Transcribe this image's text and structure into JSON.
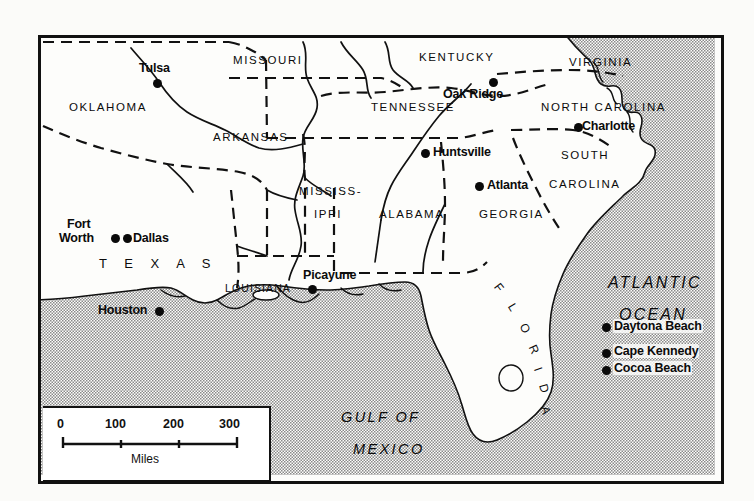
{
  "map": {
    "title": "Southeastern United States reference map",
    "frame": {
      "x": 38,
      "y": 35,
      "w": 680,
      "h": 443
    },
    "colors": {
      "land": "#fdfdfb",
      "water_stipple": "#8d8d8d",
      "ink": "#0b0b0b",
      "page": "#fbfaf8"
    }
  },
  "states": [
    {
      "name": "OKLAHOMA",
      "x": 28,
      "y": 63,
      "cls": "state"
    },
    {
      "name": "MISSOURI",
      "x": 192,
      "y": 16,
      "cls": "state"
    },
    {
      "name": "ARKANSAS",
      "x": 172,
      "y": 93,
      "cls": "state"
    },
    {
      "name": "KENTUCKY",
      "x": 378,
      "y": 13,
      "cls": "state"
    },
    {
      "name": "VIRGINIA",
      "x": 528,
      "y": 18,
      "cls": "state"
    },
    {
      "name": "TENNESSEE",
      "x": 330,
      "y": 63,
      "cls": "state"
    },
    {
      "name": "NORTH  CAROLINA",
      "x": 500,
      "y": 63,
      "cls": "state"
    },
    {
      "name": "SOUTH",
      "x": 520,
      "y": 111,
      "cls": "state"
    },
    {
      "name": "CAROLINA",
      "x": 508,
      "y": 140,
      "cls": "state"
    },
    {
      "name": "MISSISS-",
      "x": 258,
      "y": 147,
      "cls": "state"
    },
    {
      "name": "IPPI",
      "x": 273,
      "y": 170,
      "cls": "state"
    },
    {
      "name": "ALABAMA",
      "x": 338,
      "y": 170,
      "cls": "state"
    },
    {
      "name": "GEORGIA",
      "x": 438,
      "y": 170,
      "cls": "state"
    },
    {
      "name": "LOUISIANA",
      "x": 184,
      "y": 244,
      "cls": "state"
    },
    {
      "name": "T E X A S",
      "x": 58,
      "y": 218,
      "cls": "texas"
    }
  ],
  "florida_arc": {
    "letters": [
      "F",
      "L",
      "O",
      "R",
      "I",
      "D",
      "A"
    ],
    "label": "FLORIDA"
  },
  "cities": [
    {
      "name": "Tulsa",
      "label_x": 98,
      "label_y": 23,
      "dot_x": 112,
      "dot_y": 41,
      "anchor": "label-above"
    },
    {
      "name": "Oak Ridge",
      "label_x": 402,
      "label_y": 49,
      "dot_x": 448,
      "dot_y": 40,
      "anchor": "label-left-below"
    },
    {
      "name": "Charlotte",
      "label_x": 541,
      "label_y": 81,
      "dot_x": 533,
      "dot_y": 85,
      "anchor": "label-right"
    },
    {
      "name": "Huntsville",
      "label_x": 392,
      "label_y": 107,
      "dot_x": 380,
      "dot_y": 111,
      "anchor": "label-right"
    },
    {
      "name": "Atlanta",
      "label_x": 446,
      "label_y": 140,
      "dot_x": 434,
      "dot_y": 144,
      "anchor": "label-right"
    },
    {
      "name": "Fort",
      "label_x": 26,
      "label_y": 178,
      "dot_x": 71,
      "dot_y": 196,
      "anchor": "stacked"
    },
    {
      "name": "Worth",
      "label_x": 21,
      "label_y": 192,
      "dot_x": 71,
      "dot_y": 196,
      "anchor": "stacked"
    },
    {
      "name": "Dallas",
      "label_x": 90,
      "label_y": 192,
      "dot_x": 81,
      "dot_y": 196,
      "anchor": "label-right"
    },
    {
      "name": "Picayune",
      "label_x": 262,
      "label_y": 230,
      "dot_x": 267,
      "dot_y": 247,
      "anchor": "label-above"
    },
    {
      "name": "Houston",
      "label_x": 57,
      "label_y": 265,
      "dot_x": 114,
      "dot_y": 269,
      "anchor": "label-left"
    },
    {
      "name": "Daytona Beach",
      "label_x": 572,
      "label_y": 281,
      "dot_x": 561,
      "dot_y": 285,
      "anchor": "label-right"
    },
    {
      "name": "Cape Kennedy",
      "label_x": 572,
      "label_y": 307,
      "dot_x": 561,
      "dot_y": 311,
      "anchor": "label-right"
    },
    {
      "name": "Cocoa Beach",
      "label_x": 572,
      "label_y": 324,
      "dot_x": 561,
      "dot_y": 328,
      "anchor": "label-right"
    }
  ],
  "water_labels": [
    {
      "name": "ATLANTIC",
      "x": 567,
      "y": 236,
      "cls": "ocean"
    },
    {
      "name": "OCEAN",
      "x": 578,
      "y": 268,
      "cls": "ocean"
    },
    {
      "name": "GULF  OF",
      "x": 300,
      "y": 371,
      "cls": "gulf"
    },
    {
      "name": "MEXICO",
      "x": 312,
      "y": 403,
      "cls": "gulf"
    }
  ],
  "scale_bar": {
    "ticks": [
      "0",
      "100",
      "200",
      "300"
    ],
    "tick_x": [
      18,
      74,
      132,
      188
    ],
    "units_label": "Miles",
    "bar_start_px": 20,
    "bar_end_px": 192
  }
}
